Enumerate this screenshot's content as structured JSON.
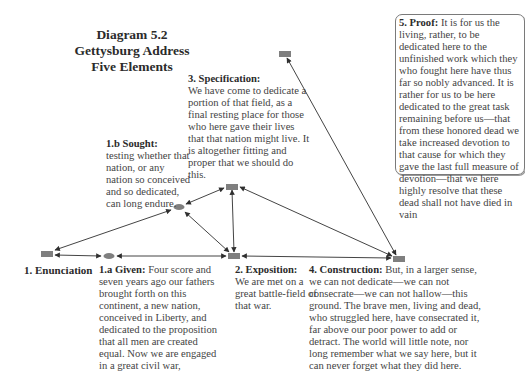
{
  "title": {
    "line1": "Diagram 5.2",
    "line2": "Gettysburg Address",
    "line3": "Five Elements"
  },
  "colors": {
    "node": "#7f7f7f",
    "arrow": "#2f2f2f",
    "text": "#444444",
    "heading": "#2b2b2b"
  },
  "nodes": [
    {
      "id": "enunciation",
      "shape": "rect",
      "x": 41,
      "y": 251
    },
    {
      "id": "given",
      "shape": "ellipse",
      "x": 109,
      "y": 256
    },
    {
      "id": "sought",
      "shape": "ellipse",
      "x": 179,
      "y": 207
    },
    {
      "id": "specification",
      "shape": "rect",
      "x": 226,
      "y": 184
    },
    {
      "id": "exposition",
      "shape": "rect",
      "x": 228,
      "y": 254
    },
    {
      "id": "construction",
      "shape": "rect",
      "x": 393,
      "y": 256
    },
    {
      "id": "proof",
      "shape": "rect",
      "x": 279,
      "y": 52
    }
  ],
  "elements": {
    "enunciation": {
      "label": "1. Enunciation"
    },
    "given": {
      "heading": "1.a Given:",
      "text": "Four score and seven years ago our fathers brought forth on this continent, a new nation, conceived in Liberty, and dedicated to the proposition that all men are created equal. Now we are engaged in a great civil war,"
    },
    "sought": {
      "heading": "1.b Sought:",
      "text": "testing whether that nation, or any nation so conceived and so dedicated, can long endure."
    },
    "exposition": {
      "heading": "2. Exposition:",
      "text": "We are met on a great battle-field of that war."
    },
    "specification": {
      "heading": "3. Specification:",
      "text": "We have come to dedicate a portion of that field, as a final resting place for those who here gave their lives that that nation might live. It is altogether fitting and proper that we should do this."
    },
    "construction": {
      "heading": "4. Construction:",
      "text": "But, in a larger sense, we can not dedicate—we can not consecrate—we can not hallow—this ground. The brave men, living and dead, who struggled here, have consecrated it, far above our poor power to add or detract. The world will little note, nor long remember what we say here, but it can never forget what they did here."
    },
    "proof": {
      "heading": "5. Proof:",
      "text": "It is for us the living, rather, to be dedicated here to the unfinished work which they who fought here have thus far so nobly advanced. It is rather for us to be here dedicated to the great task remaining before us—that from these honored dead we take increased devotion to that cause for which they gave the last full measure of devotion—that we here highly resolve that these dead shall not have died in vain"
    }
  },
  "links": [
    {
      "from": "enunciation",
      "to": "given",
      "type": "bidirectional"
    },
    {
      "from": "enunciation",
      "to": "sought",
      "type": "bidirectional"
    },
    {
      "from": "given",
      "to": "exposition",
      "type": "bidirectional"
    },
    {
      "from": "sought",
      "to": "specification",
      "type": "bidirectional"
    },
    {
      "from": "sought",
      "to": "exposition",
      "type": "bidirectional"
    },
    {
      "from": "specification",
      "to": "exposition",
      "type": "bidirectional"
    },
    {
      "from": "specification",
      "to": "construction",
      "type": "bidirectional"
    },
    {
      "from": "exposition",
      "to": "construction",
      "type": "bidirectional"
    },
    {
      "from": "construction",
      "to": "proof",
      "type": "bidirectional"
    }
  ]
}
